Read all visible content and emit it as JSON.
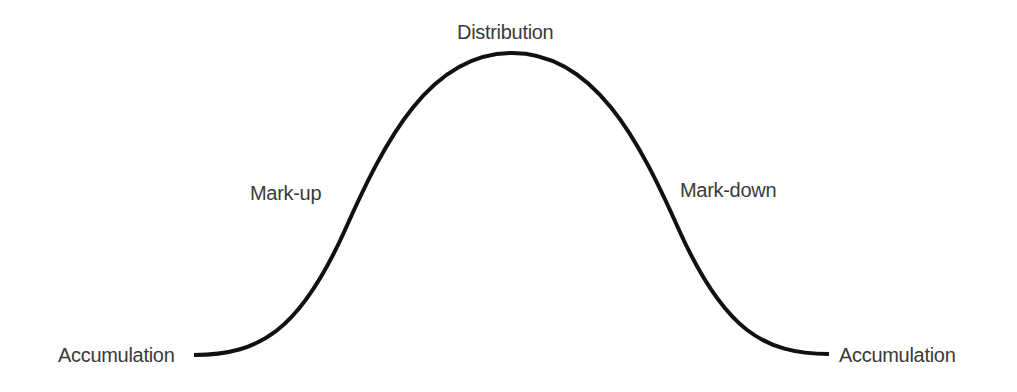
{
  "diagram": {
    "curve_color": "#111111",
    "label_color": "#3a3a3a",
    "phases": {
      "start": "Accumulation",
      "rise": "Mark-up",
      "peak": "Distribution",
      "fall": "Mark-down",
      "end": "Accumulation"
    }
  }
}
